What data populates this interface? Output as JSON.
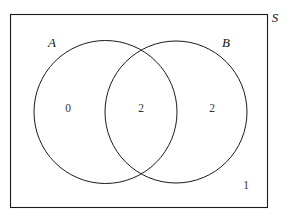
{
  "diagram": {
    "type": "venn-two-set",
    "universe": {
      "label": "S",
      "label_position": "outside-top-right"
    },
    "sets": [
      {
        "id": "A",
        "label": "A",
        "label_position": "outside-upper-left"
      },
      {
        "id": "B",
        "label": "B",
        "label_position": "outside-upper-right"
      }
    ],
    "regions": [
      {
        "id": "a-only",
        "label": "0",
        "description": "A only"
      },
      {
        "id": "intersection",
        "label": "2",
        "description": "A and B"
      },
      {
        "id": "b-only",
        "label": "2",
        "description": "B only"
      },
      {
        "id": "outside",
        "label": "1",
        "description": "Outside A and B"
      }
    ],
    "colors": {
      "stroke": "#1a1a1a",
      "background": "#ffffff",
      "label_text": "#111111",
      "count_text": "#333333"
    }
  }
}
